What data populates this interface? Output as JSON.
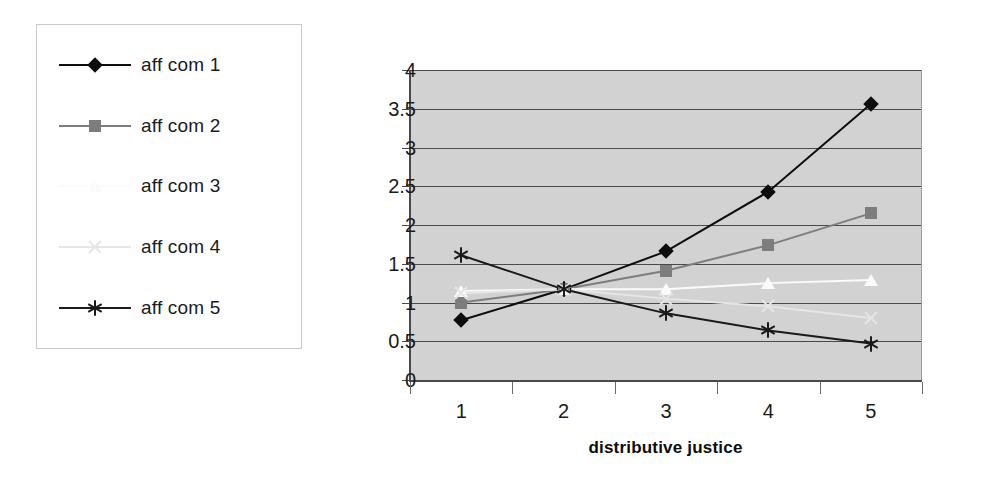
{
  "chart_data": {
    "type": "line",
    "title": "",
    "subtitle": "",
    "xlabel": "distributive justice",
    "ylabel": "",
    "categories": [
      "1",
      "2",
      "3",
      "4",
      "5"
    ],
    "x": [
      1,
      2,
      3,
      4,
      5
    ],
    "xlim": [
      1,
      5
    ],
    "ylim": [
      0,
      4
    ],
    "ytick_labels": [
      "0",
      "0.5",
      "1",
      "1.5",
      "2",
      "2.5",
      "3",
      "3.5",
      "4"
    ],
    "ytick_values": [
      0,
      0.5,
      1,
      1.5,
      2,
      2.5,
      3,
      3.5,
      4
    ],
    "xtick_labels": [
      "1",
      "2",
      "3",
      "4",
      "5"
    ],
    "grid": "horizontal",
    "legend_position": "left-outside",
    "plot_background": "#d2d2d2",
    "series": [
      {
        "name": "aff com 1",
        "marker": "diamond",
        "color": "#0d0d0d",
        "line_color": "#0d0d0d",
        "values": [
          0.77,
          1.17,
          1.66,
          2.43,
          3.56
        ]
      },
      {
        "name": "aff com 2",
        "marker": "square",
        "color": "#7d7d7d",
        "line_color": "#7d7d7d",
        "values": [
          1.0,
          1.17,
          1.41,
          1.74,
          2.15
        ]
      },
      {
        "name": "aff com 3",
        "marker": "triangle",
        "color": "#fbfbfb",
        "line_color": "#fbfbfb",
        "values": [
          1.15,
          1.17,
          1.17,
          1.25,
          1.29
        ]
      },
      {
        "name": "aff com 4",
        "marker": "x",
        "color": "#e6e6e6",
        "line_color": "#e6e6e6",
        "values": [
          1.12,
          1.17,
          1.05,
          0.95,
          0.8
        ]
      },
      {
        "name": "aff com 5",
        "marker": "star",
        "color": "#1a1a1a",
        "line_color": "#1a1a1a",
        "values": [
          1.61,
          1.17,
          0.86,
          0.64,
          0.47
        ]
      }
    ]
  },
  "legend": {
    "items": [
      {
        "label": "aff com 1"
      },
      {
        "label": "aff com 2"
      },
      {
        "label": "aff com 3"
      },
      {
        "label": "aff com 4"
      },
      {
        "label": "aff com 5"
      }
    ]
  }
}
